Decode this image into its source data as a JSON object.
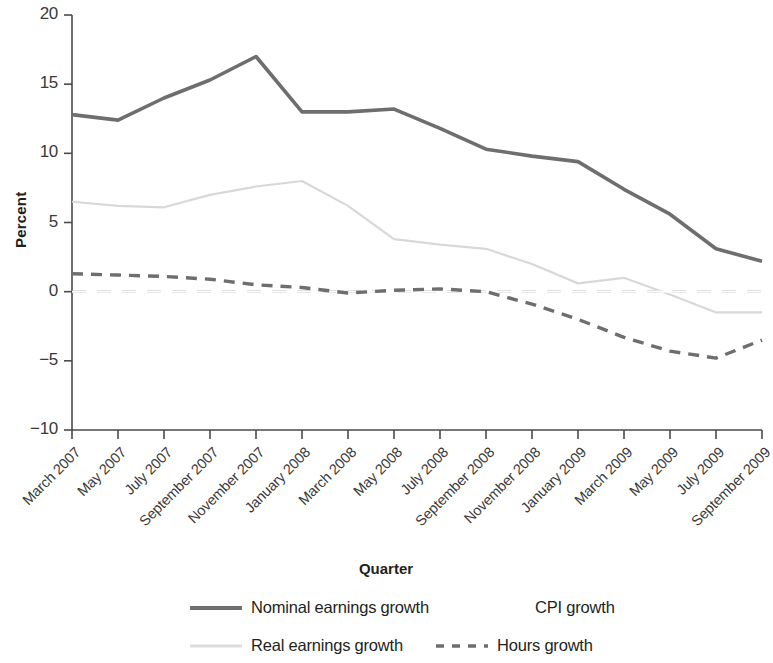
{
  "chart_data": {
    "type": "line",
    "title": "",
    "xlabel": "Quarter",
    "ylabel": "Percent",
    "ylim": [
      -10,
      20
    ],
    "yticks": [
      20,
      15,
      10,
      5,
      0,
      -5,
      -10
    ],
    "ytick_labels": [
      "20",
      "15",
      "10",
      "5",
      "0",
      "−5",
      "−10"
    ],
    "grid": false,
    "legend_position": "bottom",
    "categories": [
      "March 2007",
      "May 2007",
      "July 2007",
      "September 2007",
      "November 2007",
      "January 2008",
      "March 2008",
      "May 2008",
      "July 2008",
      "September 2008",
      "November 2008",
      "January 2009",
      "March 2009",
      "May 2009",
      "July 2009",
      "September 2009"
    ],
    "series": [
      {
        "name": "Nominal earnings growth",
        "color": "#6e6e6e",
        "style": "solid",
        "width": 3.6,
        "values": [
          12.8,
          12.4,
          14.0,
          15.3,
          17.0,
          13.0,
          13.0,
          13.2,
          11.8,
          10.3,
          9.8,
          9.4,
          7.4,
          5.6,
          3.1,
          2.2
        ]
      },
      {
        "name": "Real earnings growth",
        "color": "#d8d8d8",
        "style": "solid",
        "width": 2.2,
        "values": [
          6.5,
          6.2,
          6.1,
          7.0,
          7.6,
          8.0,
          6.2,
          3.8,
          3.4,
          3.1,
          2.0,
          0.6,
          1.0,
          -0.2,
          -1.5,
          -1.5
        ]
      },
      {
        "name": "CPI growth",
        "color": "#fefefe",
        "style": "solid",
        "width": 2.0,
        "values": [
          0.0,
          0.0,
          0.0,
          0.0,
          0.0,
          0.0,
          0.0,
          0.0,
          0.0,
          0.0,
          0.0,
          0.0,
          0.0,
          0.0,
          0.0,
          0.0
        ]
      },
      {
        "name": "Hours growth",
        "color": "#6e6e6e",
        "style": "dashed",
        "width": 3.4,
        "values": [
          1.3,
          1.2,
          1.1,
          0.9,
          0.5,
          0.3,
          -0.1,
          0.1,
          0.2,
          0.0,
          -0.9,
          -2.0,
          -3.3,
          -4.3,
          -4.8,
          -3.5
        ]
      }
    ],
    "zero_line": {
      "name": "zero reference",
      "value": 0,
      "color": "#555555",
      "style": "long-dashed",
      "width": 1.8
    }
  },
  "legend": {
    "entries": [
      {
        "label": "Nominal earnings growth",
        "swatch": "solid-dark"
      },
      {
        "label": "CPI growth",
        "swatch": "none"
      },
      {
        "label": "Real earnings growth",
        "swatch": "solid-light"
      },
      {
        "label": "Hours growth",
        "swatch": "dashed-dark"
      }
    ]
  }
}
